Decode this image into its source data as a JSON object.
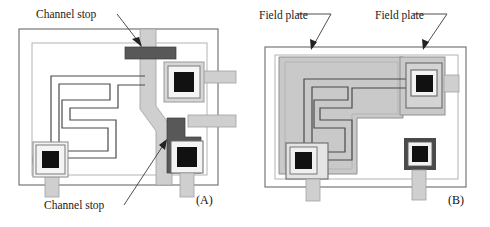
{
  "figure": {
    "width": 490,
    "height": 227,
    "background": "#ffffff"
  },
  "panels": [
    {
      "id": "A",
      "label": "(A)",
      "label_pos": {
        "x": 196,
        "y": 203
      },
      "technique": "Channel stop",
      "annotations": [
        {
          "name": "channel-stop-top",
          "text": "Channel stop",
          "text_pos": {
            "x": 36,
            "y": 18
          },
          "leader": "M 117,14 L 141,45",
          "arrow": "M 141,45 L 134,40 L 139,38 Z",
          "target": "top-channel-stop-bar"
        },
        {
          "name": "channel-stop-bottom",
          "text": "Channel stop",
          "text_pos": {
            "x": 44,
            "y": 209
          },
          "leader": "M 126,205 L 165,142",
          "arrow": "M 165,142 L 162,150 L 158,145 Z",
          "target": "right-channel-stop-bar"
        }
      ]
    },
    {
      "id": "B",
      "label": "(B)",
      "label_pos": {
        "x": 448,
        "y": 203
      },
      "technique": "Field plate",
      "annotations": [
        {
          "name": "field-plate-left",
          "text": "Field plate",
          "text_pos": {
            "x": 259,
            "y": 20
          },
          "leader": "M 329,16 L 313,48",
          "arrow": "M 313,48 L 312,40 L 318,42 Z",
          "target": "left-field-plate"
        },
        {
          "name": "field-plate-right",
          "text": "Field plate",
          "text_pos": {
            "x": 375,
            "y": 20
          },
          "leader": "M 443,16 L 424,48",
          "arrow": "M 424,48 L 424,40 L 430,42 Z",
          "target": "right-field-plate"
        }
      ]
    }
  ],
  "colors": {
    "outline_dark": "#5a5a5a",
    "outline_light": "#aaaaaa",
    "metal_light_gray": "#cccccc",
    "field_plate_gray": "#c9c9c9",
    "channel_stop_dark": "#585858",
    "contact_black": "#111111",
    "contact_white": "#f2f2f2",
    "trace_line": "#4a4a4a",
    "text": "#1a1a1a"
  },
  "legend_terms": {
    "channel_stop": "Channel stop",
    "field_plate": "Field plate",
    "panel_a": "(A)",
    "panel_b": "(B)"
  }
}
